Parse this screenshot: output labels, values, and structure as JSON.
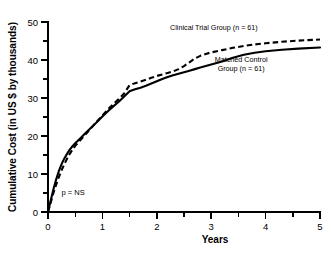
{
  "chart_data": {
    "type": "line",
    "title": "",
    "xlabel": "Years",
    "ylabel": "Cumulative Cost (in US $ by thousands)",
    "xlim": [
      0,
      5
    ],
    "ylim": [
      0,
      50
    ],
    "grid": false,
    "legend_position": "inline-right",
    "x_ticks": [
      "0",
      "1",
      "2",
      "3",
      "4",
      "5"
    ],
    "x_tick_values": [
      0,
      1,
      2,
      3,
      4,
      5
    ],
    "x_minor_tick_values": [
      0.5,
      1.5,
      2.5,
      3.5,
      4.5
    ],
    "y_ticks": [
      "0",
      "10",
      "20",
      "30",
      "40",
      "50"
    ],
    "y_tick_values": [
      0,
      10,
      20,
      30,
      40,
      50
    ],
    "y_minor_tick_values": [
      5,
      15,
      25,
      35,
      45
    ],
    "annotations": [
      {
        "text": "p = NS",
        "x": 0.25,
        "y": 4.5
      }
    ],
    "series": [
      {
        "name": "Clinical Trial Group (n = 61)",
        "style": "dashed",
        "color": "#000000",
        "label_lines": [
          "Clinical Trial Group (n = 61)"
        ],
        "label_x": 3.05,
        "label_y": 48.0,
        "points": [
          [
            0.0,
            0.0
          ],
          [
            0.05,
            2.5
          ],
          [
            0.1,
            5.0
          ],
          [
            0.15,
            7.2
          ],
          [
            0.2,
            9.2
          ],
          [
            0.25,
            11.0
          ],
          [
            0.3,
            12.6
          ],
          [
            0.35,
            14.0
          ],
          [
            0.4,
            15.3
          ],
          [
            0.45,
            16.4
          ],
          [
            0.5,
            17.4
          ],
          [
            0.6,
            19.0
          ],
          [
            0.7,
            20.6
          ],
          [
            0.8,
            22.2
          ],
          [
            0.9,
            23.8
          ],
          [
            1.0,
            25.4
          ],
          [
            1.1,
            27.0
          ],
          [
            1.2,
            28.4
          ],
          [
            1.3,
            29.7
          ],
          [
            1.4,
            31.2
          ],
          [
            1.5,
            33.4
          ],
          [
            1.6,
            33.9
          ],
          [
            1.7,
            34.3
          ],
          [
            1.8,
            34.8
          ],
          [
            1.9,
            35.3
          ],
          [
            2.0,
            35.8
          ],
          [
            2.1,
            36.2
          ],
          [
            2.2,
            36.6
          ],
          [
            2.3,
            37.0
          ],
          [
            2.4,
            37.6
          ],
          [
            2.5,
            38.4
          ],
          [
            2.6,
            39.4
          ],
          [
            2.7,
            40.4
          ],
          [
            2.8,
            41.1
          ],
          [
            2.9,
            41.6
          ],
          [
            3.0,
            42.0
          ],
          [
            3.2,
            42.6
          ],
          [
            3.4,
            43.2
          ],
          [
            3.6,
            43.7
          ],
          [
            3.8,
            44.1
          ],
          [
            4.0,
            44.4
          ],
          [
            4.3,
            44.8
          ],
          [
            4.6,
            45.1
          ],
          [
            5.0,
            45.4
          ]
        ]
      },
      {
        "name": "Matched Control Group (n = 61)",
        "style": "solid",
        "color": "#000000",
        "label_lines": [
          "Matched Control",
          "Group (n = 61)"
        ],
        "label_x": 3.55,
        "label_y": 39.6,
        "points": [
          [
            0.0,
            0.0
          ],
          [
            0.05,
            3.0
          ],
          [
            0.1,
            6.0
          ],
          [
            0.15,
            8.6
          ],
          [
            0.2,
            10.8
          ],
          [
            0.25,
            12.6
          ],
          [
            0.3,
            14.1
          ],
          [
            0.35,
            15.3
          ],
          [
            0.4,
            16.4
          ],
          [
            0.45,
            17.3
          ],
          [
            0.5,
            18.1
          ],
          [
            0.6,
            19.5
          ],
          [
            0.7,
            20.9
          ],
          [
            0.8,
            22.3
          ],
          [
            0.9,
            23.7
          ],
          [
            1.0,
            25.1
          ],
          [
            1.1,
            26.5
          ],
          [
            1.2,
            27.8
          ],
          [
            1.3,
            29.0
          ],
          [
            1.4,
            30.4
          ],
          [
            1.5,
            31.8
          ],
          [
            1.6,
            32.3
          ],
          [
            1.7,
            32.7
          ],
          [
            1.8,
            33.2
          ],
          [
            1.9,
            33.8
          ],
          [
            2.0,
            34.4
          ],
          [
            2.1,
            35.0
          ],
          [
            2.2,
            35.5
          ],
          [
            2.3,
            36.0
          ],
          [
            2.4,
            36.4
          ],
          [
            2.5,
            36.8
          ],
          [
            2.6,
            37.2
          ],
          [
            2.7,
            37.6
          ],
          [
            2.8,
            38.0
          ],
          [
            2.9,
            38.4
          ],
          [
            3.0,
            38.8
          ],
          [
            3.2,
            39.6
          ],
          [
            3.4,
            40.6
          ],
          [
            3.6,
            41.4
          ],
          [
            3.8,
            41.9
          ],
          [
            4.0,
            42.3
          ],
          [
            4.3,
            42.7
          ],
          [
            4.6,
            43.0
          ],
          [
            5.0,
            43.3
          ]
        ]
      }
    ]
  }
}
